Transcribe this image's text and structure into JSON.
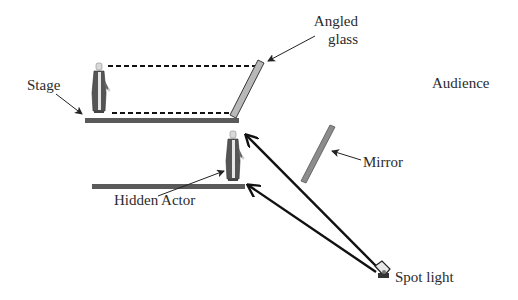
{
  "diagram": {
    "labels": {
      "stage": "Stage",
      "angled_glass_line1": "Angled",
      "angled_glass_line2": "glass",
      "audience": "Audience",
      "mirror": "Mirror",
      "hidden_actor": "Hidden Actor",
      "spot_light": "Spot light"
    },
    "icons": [
      "actor-figure-icon",
      "spotlight-icon"
    ],
    "colors": {
      "stage_fill": "#5a5a5a",
      "glass_fill": "#b8b8b8",
      "glass_stroke": "#3a3a3a",
      "mirror_fill": "#8c8c8c",
      "line": "#111111",
      "text": "#2b2b2b"
    }
  }
}
